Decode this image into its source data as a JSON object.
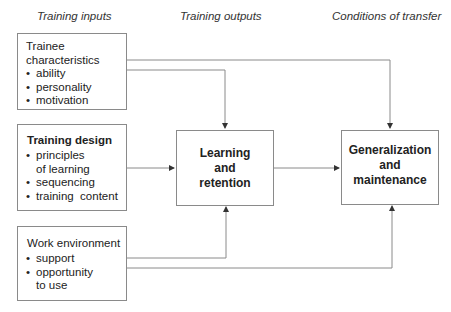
{
  "headers": {
    "inputs": "Training inputs",
    "outputs": "Training outputs",
    "transfer": "Conditions of transfer"
  },
  "inputs": {
    "trainee": {
      "title_line1": "Trainee",
      "title_line2": "characteristics",
      "items": [
        "ability",
        "personality",
        "motivation"
      ]
    },
    "design": {
      "title": "Training design",
      "items": [
        "principles",
        "of learning",
        "sequencing",
        "training  content"
      ]
    },
    "work": {
      "title": "Work environment",
      "items": [
        "support",
        "opportunity",
        "to use"
      ]
    }
  },
  "outputs": {
    "learning": {
      "line1": "Learning",
      "line2": "and",
      "line3": "retention"
    }
  },
  "transfer": {
    "generalization": {
      "line1": "Generalization",
      "line2": "and",
      "line3": "maintenance"
    }
  },
  "bullet": "•",
  "colors": {
    "line": "#8a8a8a",
    "text": "#222222"
  }
}
